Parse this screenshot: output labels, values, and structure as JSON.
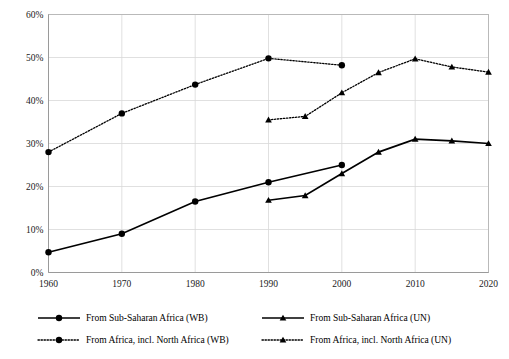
{
  "chart_data": {
    "type": "line",
    "title": "",
    "subtitle": "",
    "xlabel": "",
    "ylabel": "",
    "xlim": [
      1960,
      2020
    ],
    "ylim": [
      0,
      0.6
    ],
    "ytick_labels": [
      "0%",
      "10%",
      "20%",
      "30%",
      "40%",
      "50%",
      "60%"
    ],
    "ytick_values": [
      0,
      10,
      20,
      30,
      40,
      50,
      60
    ],
    "xtick_labels": [
      "1960",
      "1970",
      "1980",
      "1990",
      "2000",
      "2010",
      "2020"
    ],
    "xtick_values": [
      1960,
      1970,
      1980,
      1990,
      2000,
      2010,
      2020
    ],
    "grid": true,
    "legend_position": "bottom",
    "value_unit": "percent",
    "series": [
      {
        "name": "From Sub-Saharan Africa (WB)",
        "key": "ssa_wb",
        "line_style": "solid",
        "marker": "circle",
        "color": "#000000",
        "x": [
          1960,
          1970,
          1980,
          1990,
          2000
        ],
        "values": [
          4.7,
          9.0,
          16.5,
          21.0,
          25.0
        ]
      },
      {
        "name": "From Sub-Saharan Africa (UN)",
        "key": "ssa_un",
        "line_style": "solid",
        "marker": "triangle",
        "color": "#000000",
        "x": [
          1990,
          1995,
          2000,
          2005,
          2010,
          2015,
          2020
        ],
        "values": [
          16.8,
          17.9,
          23.0,
          28.0,
          31.0,
          30.6,
          30.0
        ]
      },
      {
        "name": "From Africa, incl. North Africa (WB)",
        "key": "africa_wb",
        "line_style": "dotted",
        "marker": "circle",
        "color": "#000000",
        "x": [
          1960,
          1970,
          1980,
          1990,
          2000
        ],
        "values": [
          28.0,
          37.0,
          43.7,
          49.8,
          48.2
        ]
      },
      {
        "name": "From Africa, incl. North Africa (UN)",
        "key": "africa_un",
        "line_style": "dotted",
        "marker": "triangle",
        "color": "#000000",
        "x": [
          1990,
          1995,
          2000,
          2005,
          2010,
          2015,
          2020
        ],
        "values": [
          35.5,
          36.3,
          41.8,
          46.5,
          49.7,
          47.8,
          46.6
        ]
      }
    ]
  },
  "legend": {
    "entries": [
      {
        "label": "From Sub-Saharan Africa (WB)",
        "style": "solid",
        "marker": "circle"
      },
      {
        "label": "From Sub-Saharan Africa (UN)",
        "style": "solid",
        "marker": "triangle"
      },
      {
        "label": "From Africa, incl. North Africa (WB)",
        "style": "dotted",
        "marker": "circle"
      },
      {
        "label": "From Africa, incl. North Africa (UN)",
        "style": "dotted",
        "marker": "triangle"
      }
    ]
  }
}
